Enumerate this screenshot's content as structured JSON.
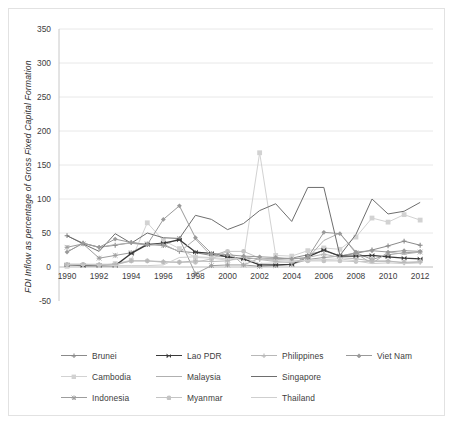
{
  "chart_data": {
    "type": "line",
    "title": "",
    "xlabel": "",
    "ylabel": "FDI Inflow as percentage of Gross Fixed Capital Formation",
    "xlim": [
      1989.5,
      2012.8
    ],
    "ylim": [
      -50,
      350
    ],
    "ytick_values": [
      -50,
      0,
      50,
      100,
      150,
      200,
      250,
      300,
      350
    ],
    "ytick_labels": [
      "-50",
      "0",
      "50",
      "100",
      "150",
      "200",
      "250",
      "300",
      "350"
    ],
    "xtick_values": [
      1990,
      1992,
      1994,
      1996,
      1998,
      2000,
      2002,
      2004,
      2006,
      2008,
      2010,
      2012
    ],
    "xtick_labels": [
      "1990",
      "1992",
      "1994",
      "1996",
      "1998",
      "2000",
      "2002",
      "2004",
      "2006",
      "2008",
      "2010",
      "2012"
    ],
    "grid": "horizontal",
    "legend_position": "bottom",
    "x": [
      1990,
      1991,
      1992,
      1993,
      1994,
      1995,
      1996,
      1997,
      1998,
      1999,
      2000,
      2001,
      2002,
      2003,
      2004,
      2005,
      2006,
      2007,
      2008,
      2009,
      2010,
      2011,
      2012
    ],
    "series": [
      {
        "name": "Brunei",
        "color": "#8a8a8a",
        "marker": "plus",
        "values": [
          46,
          35,
          29,
          32,
          36,
          33,
          32,
          23,
          21,
          17,
          15,
          13,
          12,
          12,
          13,
          18,
          24,
          16,
          20,
          25,
          31,
          38,
          32
        ]
      },
      {
        "name": "Cambodia",
        "color": "#d2d2d2",
        "marker": "square",
        "values": [
          1,
          2,
          2,
          5,
          10,
          65,
          39,
          27,
          14,
          13,
          10,
          12,
          168,
          17,
          16,
          24,
          28,
          26,
          44,
          72,
          66,
          77,
          69
        ]
      },
      {
        "name": "Indonesia",
        "color": "#9d9d9d",
        "marker": "star",
        "values": [
          29,
          34,
          13,
          17,
          21,
          34,
          32,
          42,
          -10,
          2,
          3,
          3,
          1,
          2,
          4,
          11,
          14,
          16,
          21,
          11,
          18,
          21,
          22
        ]
      },
      {
        "name": "Lao PDR",
        "color": "#3a3a3a",
        "marker": "bowtie",
        "values": [
          3,
          2,
          2,
          2,
          20,
          33,
          35,
          40,
          22,
          20,
          15,
          12,
          3,
          3,
          4,
          15,
          25,
          16,
          16,
          17,
          15,
          13,
          12
        ]
      },
      {
        "name": "Malaysia",
        "color": "#b0b0b0",
        "marker": "none",
        "values": [
          22,
          35,
          29,
          33,
          35,
          32,
          34,
          22,
          41,
          16,
          24,
          3,
          13,
          11,
          12,
          13,
          39,
          50,
          20,
          5,
          22,
          19,
          22
        ]
      },
      {
        "name": "Myanmar",
        "color": "#c4c4c4",
        "marker": "circle",
        "values": [
          4,
          4,
          3,
          3,
          9,
          9,
          7,
          7,
          7,
          12,
          23,
          23,
          13,
          9,
          9,
          9,
          9,
          9,
          8,
          8,
          8,
          7,
          8
        ]
      },
      {
        "name": "Philippines",
        "color": "#b8b8b8",
        "marker": "plus",
        "values": [
          4,
          4,
          4,
          4,
          9,
          9,
          8,
          7,
          9,
          8,
          9,
          15,
          11,
          8,
          6,
          14,
          19,
          14,
          12,
          9,
          9,
          6,
          7
        ]
      },
      {
        "name": "Singapore",
        "color": "#6e6e6e",
        "marker": "none",
        "values": [
          46,
          34,
          23,
          49,
          35,
          50,
          43,
          42,
          76,
          70,
          55,
          64,
          83,
          93,
          67,
          117,
          117,
          17,
          48,
          100,
          78,
          82,
          95
        ]
      },
      {
        "name": "Thailand",
        "color": "#cfcfcf",
        "marker": "none",
        "values": [
          3,
          3,
          3,
          2,
          2,
          2,
          3,
          14,
          15,
          14,
          12,
          14,
          5,
          6,
          8,
          10,
          11,
          12,
          9,
          5,
          6,
          5,
          6
        ]
      },
      {
        "name": "Viet Nam",
        "color": "#9a9a9a",
        "marker": "diamond",
        "values": [
          22,
          35,
          29,
          41,
          36,
          33,
          70,
          90,
          43,
          20,
          18,
          16,
          15,
          14,
          12,
          14,
          51,
          49,
          22,
          24,
          22,
          24,
          23
        ]
      }
    ]
  },
  "legend": {
    "rows": [
      [
        {
          "label": "Brunei",
          "series": "Brunei"
        },
        {
          "label": "Lao PDR",
          "series": "Lao PDR"
        },
        {
          "label": "Philippines",
          "series": "Philippines"
        },
        {
          "label": "Viet Nam",
          "series": "Viet Nam"
        }
      ],
      [
        {
          "label": "Cambodia",
          "series": "Cambodia"
        },
        {
          "label": "Malaysia",
          "series": "Malaysia"
        },
        {
          "label": "Singapore",
          "series": "Singapore"
        }
      ],
      [
        {
          "label": "Indonesia",
          "series": "Indonesia"
        },
        {
          "label": "Myanmar",
          "series": "Myanmar"
        },
        {
          "label": "Thailand",
          "series": "Thailand"
        }
      ]
    ]
  },
  "colors": {
    "grid": "#e8e8e8",
    "axis": "#c8c8c8",
    "text": "#3d3d3d",
    "frame": "#e2e2e2"
  }
}
